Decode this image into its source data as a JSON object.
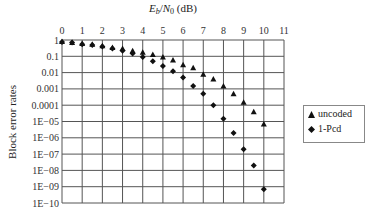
{
  "chart_data": {
    "type": "scatter",
    "title_parts": {
      "e": "E",
      "e_sub": "b",
      "slash": "/",
      "n": "N",
      "n_sub": "0",
      "unit": " (dB)"
    },
    "xlabel": "E_b/N_0 (dB)",
    "ylabel": "Block error rates",
    "xaxis_position": "top",
    "xlim": [
      0,
      11
    ],
    "ylim": [
      1e-10,
      1
    ],
    "yscale": "log",
    "grid": true,
    "legend_position": "right",
    "x_ticks": [
      "0",
      "1",
      "2",
      "3",
      "4",
      "5",
      "6",
      "7",
      "8",
      "9",
      "10",
      "11"
    ],
    "y_ticks": [
      "1",
      "0.1",
      "0.01",
      "0.001",
      "0.0001",
      "1E−05",
      "1E−06",
      "1E−07",
      "1E−08",
      "1E−09",
      "1E−10"
    ],
    "x": [
      0,
      0.5,
      1,
      1.5,
      2,
      2.5,
      3,
      3.5,
      4,
      4.5,
      5,
      5.5,
      6,
      6.5,
      7,
      7.5,
      8,
      8.5,
      9,
      9.5,
      10
    ],
    "series": [
      {
        "name": "uncoded",
        "marker": "triangle",
        "values": [
          0.8,
          0.7,
          0.6,
          0.55,
          0.45,
          0.35,
          0.3,
          0.22,
          0.18,
          0.13,
          0.09,
          0.06,
          0.03,
          0.02,
          0.008,
          0.004,
          0.0015,
          0.0005,
          0.00015,
          4e-05,
          7e-06
        ]
      },
      {
        "name": "1-Pcd",
        "marker": "diamond",
        "values": [
          0.75,
          0.7,
          0.55,
          0.5,
          0.4,
          0.3,
          0.22,
          0.15,
          0.09,
          0.05,
          0.025,
          0.012,
          0.005,
          0.0015,
          0.0005,
          0.0001,
          1.5e-05,
          2e-06,
          2e-07,
          2e-08,
          7e-10
        ]
      }
    ]
  },
  "legend": {
    "items": [
      {
        "label": "uncoded",
        "marker": "triangle"
      },
      {
        "label": "1-Pcd",
        "marker": "diamond"
      }
    ]
  }
}
